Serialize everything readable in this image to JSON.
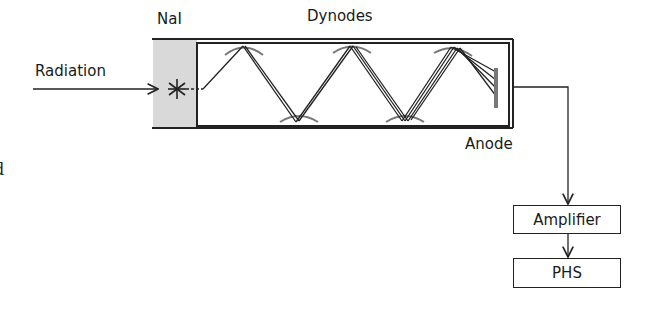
{
  "diagram": {
    "type": "scintillation-detector-schematic",
    "labels": {
      "crystal": "NaI",
      "dynodes": "Dynodes",
      "input": "Radiation",
      "anode": "Anode"
    },
    "blocks": [
      {
        "id": "amplifier",
        "label": "Amplifier"
      },
      {
        "id": "phs",
        "label": "PHS"
      }
    ],
    "edge_fragment": "d",
    "colors": {
      "stroke": "#222222",
      "crystal_fill": "#d9d9d9",
      "dynode_gray": "#777777",
      "background": "#ffffff"
    },
    "connections": [
      {
        "from": "Radiation",
        "to": "NaI"
      },
      {
        "from": "NaI",
        "to": "Dynodes"
      },
      {
        "from": "Dynodes",
        "to": "Anode"
      },
      {
        "from": "Anode",
        "to": "Amplifier"
      },
      {
        "from": "Amplifier",
        "to": "PHS"
      }
    ]
  }
}
